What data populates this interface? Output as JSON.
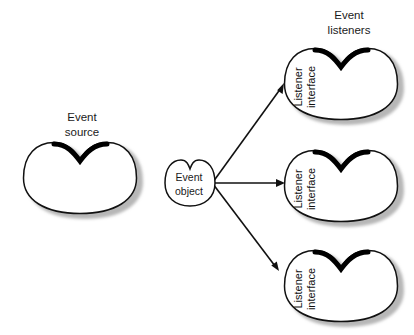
{
  "figure": {
    "type": "diagram",
    "subtype": "event-delegation-model",
    "background_color": "#ffffff",
    "outline_color": "#111111",
    "accent_color": "#000000",
    "shadow_color": "#b3b3b3",
    "text_color": "#1a1a1a"
  },
  "titles": {
    "event_source": {
      "line1": "Event",
      "line2": "source"
    },
    "event_listeners": {
      "line1": "Event",
      "line2": "listeners"
    }
  },
  "nodes": {
    "event_source": {
      "name": "event-source",
      "label_line1": "Event",
      "label_line2": "source",
      "shape": "bean",
      "has_label_inside": false
    },
    "event_object": {
      "name": "event-object",
      "label_line1": "Event",
      "label_line2": "object",
      "shape": "bean",
      "has_label_inside": true
    },
    "listeners": [
      {
        "name": "listener-interface-1",
        "label_line1": "Listener",
        "label_line2": "interface",
        "shape": "bean",
        "rotated": true
      },
      {
        "name": "listener-interface-2",
        "label_line1": "Listener",
        "label_line2": "interface",
        "shape": "bean",
        "rotated": true
      },
      {
        "name": "listener-interface-3",
        "label_line1": "Listener",
        "label_line2": "interface",
        "shape": "bean",
        "rotated": true
      }
    ]
  },
  "arrows": [
    {
      "name": "arrow-to-listener-1",
      "from": "event-object",
      "to": "listener-interface-1",
      "direction": "up-right"
    },
    {
      "name": "arrow-to-listener-2",
      "from": "event-object",
      "to": "listener-interface-2",
      "direction": "right"
    },
    {
      "name": "arrow-to-listener-3",
      "from": "event-object",
      "to": "listener-interface-3",
      "direction": "down-right"
    }
  ]
}
